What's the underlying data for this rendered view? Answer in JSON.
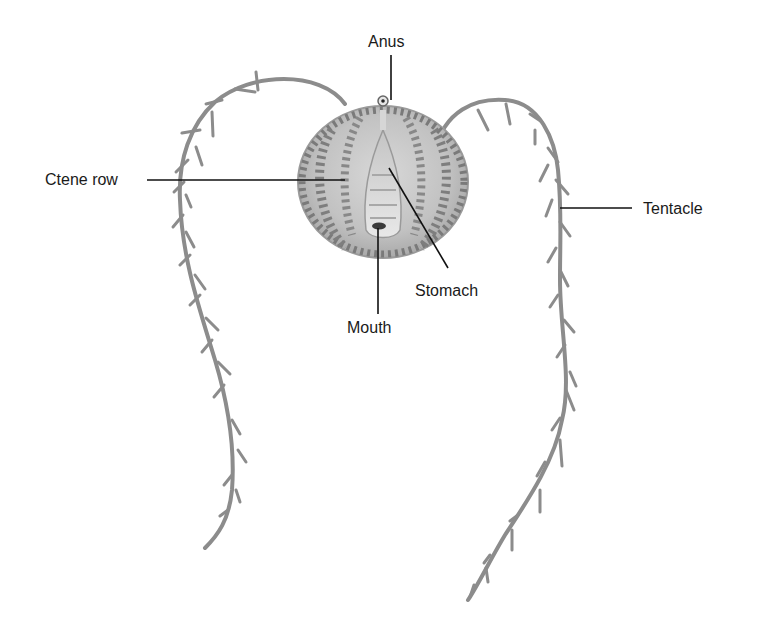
{
  "diagram": {
    "labels": {
      "anus": "Anus",
      "ctene_row": "Ctene row",
      "tentacle": "Tentacle",
      "stomach": "Stomach",
      "mouth": "Mouth"
    },
    "colors": {
      "background": "#ffffff",
      "body": "#c9c9c9",
      "body_dark": "#8a8a8a",
      "tentacle": "#8c8c8c",
      "leader_line": "#111111",
      "text": "#1a1a1a"
    }
  }
}
